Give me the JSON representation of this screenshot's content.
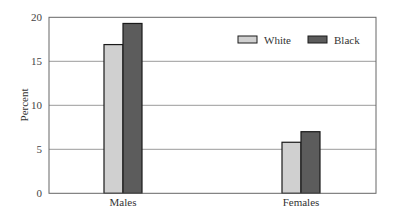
{
  "chart_data": {
    "type": "bar",
    "title": "",
    "xlabel": "",
    "ylabel": "Percent",
    "ylim": [
      0,
      20
    ],
    "yticks": [
      0,
      5,
      10,
      15,
      20
    ],
    "grid": true,
    "legend_position": "top-right inside",
    "categories": [
      "Males",
      "Females"
    ],
    "series": [
      {
        "name": "White",
        "color": "#d0d0d0",
        "values": [
          16.9,
          5.8
        ]
      },
      {
        "name": "Black",
        "color": "#5c5c5c",
        "values": [
          19.3,
          7.0
        ]
      }
    ]
  }
}
